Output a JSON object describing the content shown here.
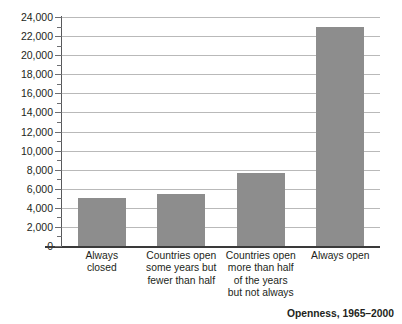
{
  "chart_data": {
    "type": "bar",
    "title": "",
    "caption": "Openness, 1965–2000",
    "xlabel": "",
    "ylabel": "",
    "ylim": [
      0,
      24000
    ],
    "ytick_step": 2000,
    "yminor_step": 1000,
    "grid": true,
    "legend": false,
    "bar_color": "#8d8d8d",
    "categories": [
      "Always\nclosed",
      "Countries open\nsome years but\nfewer than half",
      "Countries open\nmore than half\nof the years\nbut not always",
      "Always open"
    ],
    "values": [
      5000,
      5500,
      7700,
      23000
    ],
    "ytick_labels": [
      "0",
      "2,000",
      "4,000",
      "6,000",
      "8,000",
      "10,000",
      "12,000",
      "14,000",
      "16,000",
      "18,000",
      "20,000",
      "22,000",
      "24,000"
    ],
    "ytick_values": [
      0,
      2000,
      4000,
      6000,
      8000,
      10000,
      12000,
      14000,
      16000,
      18000,
      20000,
      22000,
      24000
    ]
  }
}
